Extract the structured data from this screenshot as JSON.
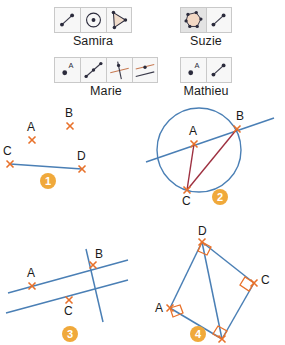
{
  "toolbars": [
    {
      "name": "Samira",
      "id": "samira",
      "tools": [
        {
          "icon": "segment-tool-icon",
          "selected": false
        },
        {
          "icon": "circle-center-point-tool-icon",
          "selected": false
        },
        {
          "icon": "polygon-triangle-tool-icon",
          "selected": false
        }
      ]
    },
    {
      "name": "Suzie",
      "id": "suzie",
      "tools": [
        {
          "icon": "filled-polygon-tool-icon",
          "selected": true
        },
        {
          "icon": "segment-tool-icon",
          "selected": false
        }
      ]
    },
    {
      "name": "Marie",
      "id": "marie",
      "tools": [
        {
          "icon": "point-label-a-tool-icon",
          "selected": false
        },
        {
          "icon": "segment-with-midpoint-tool-icon",
          "selected": false
        },
        {
          "icon": "perpendicular-line-tool-icon",
          "selected": false
        },
        {
          "icon": "parallel-line-tool-icon",
          "selected": false
        }
      ]
    },
    {
      "name": "Mathieu",
      "id": "mathieu",
      "tools": [
        {
          "icon": "point-label-a-tool-icon",
          "selected": false
        },
        {
          "icon": "segment-tool-icon",
          "selected": false
        }
      ]
    }
  ],
  "colors": {
    "line_blue": "#4a7fb5",
    "chord_dark_red": "#9e3040",
    "point_mark_orange": "#e8712a",
    "badge_amber": "#f0a93b",
    "icon_face": "#f7f7f7",
    "icon_face_selected": "#e3e3e3",
    "icon_border": "#c9c9c9",
    "polygon_fill": "#f2d8c4"
  },
  "figures": [
    {
      "number": "1",
      "id": "fig1",
      "description": "Four marked points A, B, C, D with a blue segment joining C and D",
      "points": [
        {
          "label": "A",
          "x": 32,
          "y": 36
        },
        {
          "label": "B",
          "x": 70,
          "y": 22
        },
        {
          "label": "C",
          "x": 10,
          "y": 60
        },
        {
          "label": "D",
          "x": 82,
          "y": 65
        }
      ],
      "segments": [
        {
          "from": "C",
          "to": "D",
          "color": "blue"
        }
      ]
    },
    {
      "number": "2",
      "id": "fig2",
      "description": "Circle with point A inside, B and C on the circle, a blue secant line through A and B, and dark red segments A-C and C-B",
      "circle": {
        "cx": 57,
        "cy": 48,
        "r": 42
      },
      "points": [
        {
          "label": "A",
          "x": 52,
          "y": 42
        },
        {
          "label": "B",
          "x": 95,
          "y": 27
        },
        {
          "label": "C",
          "x": 45,
          "y": 88
        }
      ],
      "secant": {
        "through": [
          "A",
          "B"
        ],
        "color": "blue"
      },
      "segments": [
        {
          "from": "A",
          "to": "C",
          "color": "dark-red"
        },
        {
          "from": "C",
          "to": "B",
          "color": "dark-red"
        }
      ]
    },
    {
      "number": "3",
      "id": "fig3",
      "description": "Two parallel blue lines carrying points A and C, crossed by a steep blue transversal through point B",
      "points": [
        {
          "label": "A",
          "x": 32,
          "y": 54
        },
        {
          "label": "B",
          "x": 93,
          "y": 33
        },
        {
          "label": "C",
          "x": 69,
          "y": 68
        }
      ],
      "lines": [
        {
          "name": "upper-parallel",
          "color": "blue"
        },
        {
          "name": "lower-parallel",
          "color": "blue"
        },
        {
          "name": "transversal",
          "color": "blue"
        }
      ]
    },
    {
      "number": "4",
      "id": "fig4",
      "description": "Quadrilateral A-D-C-B with right-angle marks at all four vertices and a diagonal from D to B",
      "points": [
        {
          "label": "A",
          "x": 28,
          "y": 86
        },
        {
          "label": "B",
          "x": 80,
          "y": 117
        },
        {
          "label": "C",
          "x": 112,
          "y": 61
        },
        {
          "label": "D",
          "x": 60,
          "y": 20
        }
      ],
      "sides": [
        {
          "from": "A",
          "to": "D",
          "color": "blue"
        },
        {
          "from": "D",
          "to": "C",
          "color": "blue"
        },
        {
          "from": "C",
          "to": "B",
          "color": "blue"
        },
        {
          "from": "B",
          "to": "A",
          "color": "blue"
        }
      ],
      "diagonal": {
        "from": "D",
        "to": "B",
        "color": "blue"
      },
      "right_angle_marks": [
        "A",
        "B",
        "C",
        "D"
      ]
    }
  ]
}
